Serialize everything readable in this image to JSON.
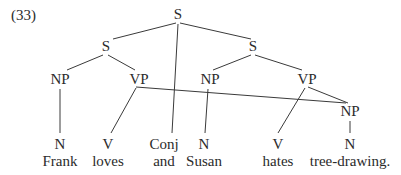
{
  "example_number": "(33)",
  "nodes": {
    "root_s": {
      "label": "S",
      "x": 178,
      "y": 19
    },
    "s_left": {
      "label": "S",
      "x": 106,
      "y": 51
    },
    "s_right": {
      "label": "S",
      "x": 253,
      "y": 51
    },
    "np_left": {
      "label": "NP",
      "x": 60,
      "y": 84
    },
    "vp_left": {
      "label": "VP",
      "x": 139,
      "y": 84
    },
    "np_right": {
      "label": "NP",
      "x": 210,
      "y": 84
    },
    "vp_right": {
      "label": "VP",
      "x": 307,
      "y": 84
    },
    "np_object": {
      "label": "NP",
      "x": 350,
      "y": 116
    },
    "n_frank": {
      "label": "N",
      "x": 60,
      "y": 149
    },
    "v_loves": {
      "label": "V",
      "x": 108,
      "y": 149
    },
    "conj": {
      "label": "Conj",
      "x": 164,
      "y": 149
    },
    "n_susan": {
      "label": "N",
      "x": 204,
      "y": 149
    },
    "v_hates": {
      "label": "V",
      "x": 278,
      "y": 149
    },
    "n_tree": {
      "label": "N",
      "x": 350,
      "y": 149
    }
  },
  "words": [
    {
      "text": "Frank",
      "x": 60
    },
    {
      "text": "loves",
      "x": 108
    },
    {
      "text": "and",
      "x": 164
    },
    {
      "text": "Susan",
      "x": 204
    },
    {
      "text": "hates",
      "x": 278
    },
    {
      "text": "tree-drawing.",
      "x": 350
    }
  ],
  "edges": [
    [
      "root_s",
      "s_left"
    ],
    [
      "root_s",
      "s_right"
    ],
    [
      "root_s",
      "conj"
    ],
    [
      "s_left",
      "np_left"
    ],
    [
      "s_left",
      "vp_left"
    ],
    [
      "s_right",
      "np_right"
    ],
    [
      "s_right",
      "vp_right"
    ],
    [
      "np_left",
      "n_frank"
    ],
    [
      "vp_left",
      "v_loves"
    ],
    [
      "vp_left",
      "np_object"
    ],
    [
      "np_right",
      "n_susan"
    ],
    [
      "vp_right",
      "v_hates"
    ],
    [
      "vp_right",
      "np_object"
    ],
    [
      "np_object",
      "n_tree"
    ]
  ],
  "colors": {
    "text": "#2b2b2b",
    "line": "#3a3a3a",
    "background": "#ffffff"
  }
}
